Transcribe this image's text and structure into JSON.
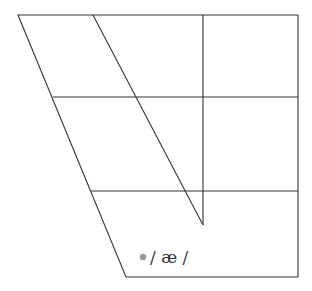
{
  "diagram": {
    "type": "vowel-chart",
    "line_color": "#333333",
    "vowels": [
      {
        "symbol": "/ æ /",
        "dot_color": "#999999"
      }
    ]
  }
}
